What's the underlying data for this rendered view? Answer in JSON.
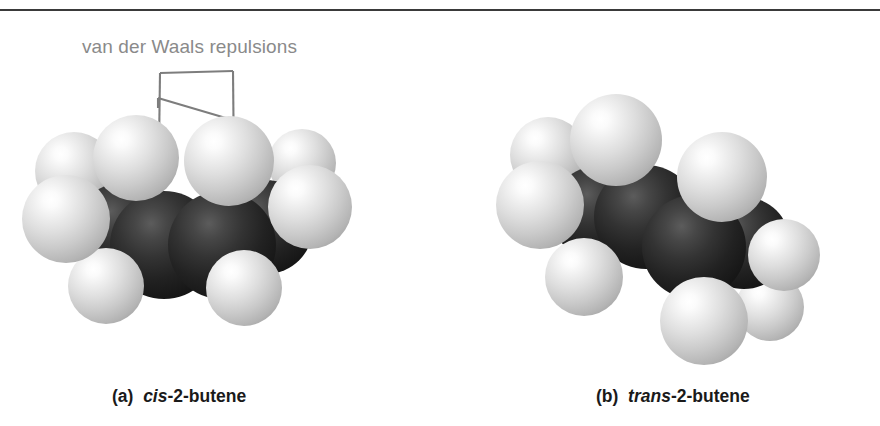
{
  "figure": {
    "top_rule_color": "#3a3a3a",
    "background_color": "#ffffff"
  },
  "annotation": {
    "label": "van der Waals repulsions",
    "label_color": "#8a8a8a",
    "leader_color": "#7d7d7d",
    "leader_name": "van-der-waals-leader-bracket"
  },
  "legend": {
    "hydrogen_color": "#cacaca",
    "carbon_color": "#1a1a1a"
  },
  "panels": [
    {
      "id": "cis",
      "caption_tag": "(a)",
      "caption_stereo": "cis",
      "caption_rest": "-2-butene",
      "model_type": "space-filling",
      "molecule": "2-butene",
      "isomer": "cis",
      "atoms": [
        {
          "element": "H",
          "label": "methyl-H-left-upper",
          "cx": 60,
          "cy": 76,
          "r": 39,
          "z": 2
        },
        {
          "element": "H",
          "label": "methyl-H-left-front",
          "cx": 52,
          "cy": 124,
          "r": 44,
          "z": 6
        },
        {
          "element": "H",
          "label": "methyl-H-left-lower",
          "cx": 92,
          "cy": 191,
          "r": 38,
          "z": 5
        },
        {
          "element": "C",
          "label": "carbon-methyl-left",
          "cx": 108,
          "cy": 135,
          "r": 47,
          "z": 3
        },
        {
          "element": "H",
          "label": "vinyl-H-left",
          "cx": 122,
          "cy": 63,
          "r": 43,
          "z": 7
        },
        {
          "element": "C",
          "label": "carbon-alkene-left",
          "cx": 150,
          "cy": 150,
          "r": 54,
          "z": 4
        },
        {
          "element": "C",
          "label": "carbon-alkene-right",
          "cx": 208,
          "cy": 150,
          "r": 54,
          "z": 4
        },
        {
          "element": "H",
          "label": "vinyl-H-right",
          "cx": 215,
          "cy": 66,
          "r": 45,
          "z": 8
        },
        {
          "element": "C",
          "label": "carbon-methyl-right",
          "cx": 252,
          "cy": 132,
          "r": 47,
          "z": 3
        },
        {
          "element": "H",
          "label": "methyl-H-right-lower",
          "cx": 230,
          "cy": 193,
          "r": 38,
          "z": 5
        },
        {
          "element": "H",
          "label": "methyl-H-right-front",
          "cx": 296,
          "cy": 112,
          "r": 42,
          "z": 6
        },
        {
          "element": "H",
          "label": "methyl-H-right-upper",
          "cx": 288,
          "cy": 68,
          "r": 34,
          "z": 2
        }
      ]
    },
    {
      "id": "trans",
      "caption_tag": "(b)",
      "caption_stereo": "trans",
      "caption_rest": "-2-butene",
      "model_type": "space-filling",
      "molecule": "2-butene",
      "isomer": "trans",
      "atoms": [
        {
          "element": "H",
          "label": "methyl-H-left-upper",
          "cx": 50,
          "cy": 60,
          "r": 38,
          "z": 2
        },
        {
          "element": "H",
          "label": "methyl-H-left-front",
          "cx": 42,
          "cy": 110,
          "r": 44,
          "z": 6
        },
        {
          "element": "H",
          "label": "methyl-H-left-lower",
          "cx": 86,
          "cy": 182,
          "r": 39,
          "z": 5
        },
        {
          "element": "C",
          "label": "carbon-methyl-left",
          "cx": 100,
          "cy": 118,
          "r": 47,
          "z": 3
        },
        {
          "element": "H",
          "label": "vinyl-H-left-top",
          "cx": 118,
          "cy": 45,
          "r": 46,
          "z": 7
        },
        {
          "element": "C",
          "label": "carbon-alkene-left",
          "cx": 148,
          "cy": 122,
          "r": 52,
          "z": 4
        },
        {
          "element": "C",
          "label": "carbon-alkene-right",
          "cx": 196,
          "cy": 152,
          "r": 52,
          "z": 4
        },
        {
          "element": "H",
          "label": "vinyl-H-right-bottom",
          "cx": 206,
          "cy": 226,
          "r": 44,
          "z": 7
        },
        {
          "element": "C",
          "label": "carbon-methyl-right",
          "cx": 246,
          "cy": 148,
          "r": 46,
          "z": 3
        },
        {
          "element": "H",
          "label": "methyl-H-right-upper",
          "cx": 224,
          "cy": 82,
          "r": 45,
          "z": 6
        },
        {
          "element": "H",
          "label": "methyl-H-right-front",
          "cx": 286,
          "cy": 160,
          "r": 36,
          "z": 5
        },
        {
          "element": "H",
          "label": "methyl-H-right-lower",
          "cx": 272,
          "cy": 212,
          "r": 34,
          "z": 2
        }
      ]
    }
  ]
}
